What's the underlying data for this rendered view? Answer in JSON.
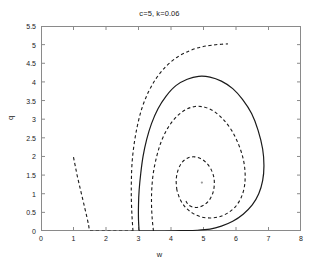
{
  "chart_data": {
    "type": "line",
    "title": "c=5, k=0.06",
    "xlabel": "w",
    "ylabel": "q",
    "xlim": [
      0,
      8
    ],
    "ylim": [
      0,
      5.5
    ],
    "xticks": [
      "0",
      "1",
      "2",
      "3",
      "4",
      "5",
      "6",
      "7",
      "8"
    ],
    "xtick_values": [
      0,
      1,
      2,
      3,
      4,
      5,
      6,
      7,
      8
    ],
    "yticks": [
      "0",
      "0.5",
      "1",
      "1.5",
      "2",
      "2.5",
      "3",
      "3.5",
      "4",
      "4.5",
      "5",
      "5.5"
    ],
    "ytick_values": [
      0,
      0.5,
      1,
      1.5,
      2,
      2.5,
      3,
      3.5,
      4,
      4.5,
      5,
      5.5
    ],
    "grid": false,
    "legend": "none",
    "line_color": "#1a1a1a",
    "background": "#ffffff",
    "annotations": [
      {
        "name": "fixed-point",
        "w": 4.95,
        "q": 1.3,
        "marker": "dot"
      }
    ],
    "series": [
      {
        "name": "limit-cycle",
        "style": "solid",
        "color": "#1a1a1a",
        "points": [
          [
            3.02,
            0.0
          ],
          [
            3.0,
            0.3
          ],
          [
            3.0,
            0.7
          ],
          [
            3.02,
            1.1
          ],
          [
            3.07,
            1.55
          ],
          [
            3.14,
            2.0
          ],
          [
            3.25,
            2.45
          ],
          [
            3.4,
            2.88
          ],
          [
            3.6,
            3.28
          ],
          [
            3.85,
            3.62
          ],
          [
            4.15,
            3.9
          ],
          [
            4.5,
            4.07
          ],
          [
            4.85,
            4.15
          ],
          [
            5.2,
            4.13
          ],
          [
            5.55,
            4.02
          ],
          [
            5.9,
            3.82
          ],
          [
            6.2,
            3.53
          ],
          [
            6.48,
            3.15
          ],
          [
            6.68,
            2.7
          ],
          [
            6.82,
            2.2
          ],
          [
            6.86,
            1.75
          ],
          [
            6.82,
            1.35
          ],
          [
            6.7,
            1.0
          ],
          [
            6.5,
            0.7
          ],
          [
            6.22,
            0.45
          ],
          [
            5.9,
            0.26
          ],
          [
            5.55,
            0.13
          ],
          [
            5.2,
            0.05
          ],
          [
            4.8,
            0.02
          ],
          [
            4.3,
            0.01
          ],
          [
            3.8,
            0.0
          ],
          [
            3.4,
            0.0
          ],
          [
            3.02,
            0.0
          ]
        ]
      },
      {
        "name": "outer-trajectory-dashed",
        "style": "dashed",
        "color": "#1a1a1a",
        "points": [
          [
            2.83,
            0.0
          ],
          [
            2.8,
            0.4
          ],
          [
            2.78,
            0.85
          ],
          [
            2.78,
            1.3
          ],
          [
            2.8,
            1.8
          ],
          [
            2.86,
            2.3
          ],
          [
            2.96,
            2.8
          ],
          [
            3.1,
            3.28
          ],
          [
            3.3,
            3.72
          ],
          [
            3.55,
            4.1
          ],
          [
            3.85,
            4.42
          ],
          [
            4.2,
            4.67
          ],
          [
            4.58,
            4.84
          ],
          [
            4.95,
            4.94
          ],
          [
            5.3,
            4.99
          ],
          [
            5.55,
            5.01
          ],
          [
            5.75,
            5.02
          ]
        ]
      },
      {
        "name": "outer-trajectory-left-branch",
        "style": "dashed",
        "color": "#1a1a1a",
        "points": [
          [
            1.0,
            1.98
          ],
          [
            1.06,
            1.72
          ],
          [
            1.12,
            1.46
          ],
          [
            1.19,
            1.2
          ],
          [
            1.26,
            0.94
          ],
          [
            1.33,
            0.68
          ],
          [
            1.4,
            0.42
          ],
          [
            1.46,
            0.18
          ],
          [
            1.5,
            0.02
          ],
          [
            1.6,
            0.0
          ],
          [
            1.9,
            0.0
          ],
          [
            2.2,
            0.0
          ],
          [
            2.5,
            0.0
          ],
          [
            2.83,
            0.0
          ]
        ]
      },
      {
        "name": "middle-spiral-dashed",
        "style": "dashed",
        "color": "#1a1a1a",
        "points": [
          [
            3.46,
            0.0
          ],
          [
            3.42,
            0.35
          ],
          [
            3.4,
            0.75
          ],
          [
            3.41,
            1.15
          ],
          [
            3.46,
            1.58
          ],
          [
            3.56,
            2.0
          ],
          [
            3.7,
            2.4
          ],
          [
            3.9,
            2.76
          ],
          [
            4.15,
            3.05
          ],
          [
            4.44,
            3.25
          ],
          [
            4.74,
            3.34
          ],
          [
            5.04,
            3.32
          ],
          [
            5.34,
            3.2
          ],
          [
            5.62,
            2.98
          ],
          [
            5.88,
            2.68
          ],
          [
            6.08,
            2.32
          ],
          [
            6.22,
            1.94
          ],
          [
            6.28,
            1.56
          ],
          [
            6.26,
            1.2
          ],
          [
            6.16,
            0.9
          ],
          [
            5.98,
            0.65
          ],
          [
            5.74,
            0.48
          ],
          [
            5.48,
            0.38
          ],
          [
            5.2,
            0.35
          ],
          [
            4.92,
            0.38
          ],
          [
            4.66,
            0.48
          ],
          [
            4.44,
            0.64
          ],
          [
            4.28,
            0.85
          ],
          [
            4.18,
            1.1
          ]
        ]
      },
      {
        "name": "inner-spiral-dashed",
        "style": "dashed",
        "color": "#1a1a1a",
        "points": [
          [
            4.18,
            1.1
          ],
          [
            4.16,
            1.38
          ],
          [
            4.22,
            1.64
          ],
          [
            4.34,
            1.84
          ],
          [
            4.52,
            1.96
          ],
          [
            4.72,
            1.99
          ],
          [
            4.92,
            1.94
          ],
          [
            5.1,
            1.82
          ],
          [
            5.24,
            1.64
          ],
          [
            5.32,
            1.43
          ],
          [
            5.33,
            1.21
          ],
          [
            5.28,
            1.0
          ],
          [
            5.17,
            0.82
          ],
          [
            5.02,
            0.7
          ],
          [
            4.85,
            0.64
          ],
          [
            4.68,
            0.64
          ],
          [
            4.54,
            0.7
          ],
          [
            4.46,
            0.8
          ]
        ]
      }
    ]
  },
  "figure": {
    "title": "c=5, k=0.06",
    "xlabel": "w",
    "ylabel": "q"
  }
}
